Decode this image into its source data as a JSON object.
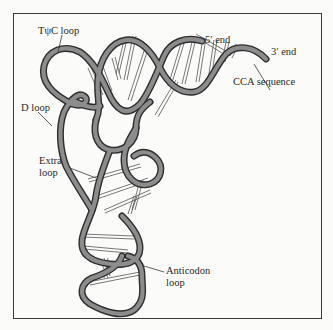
{
  "figure": {
    "labels": {
      "tpsic_loop": "TψC loop",
      "five_prime_end": "5′ end",
      "three_prime_end": "3′ end",
      "cca_sequence": "CCA sequence",
      "d_loop": "D loop",
      "extra_loop_line1": "Extra",
      "extra_loop_line2": "loop",
      "anticodon_loop_line1": "Anticodon",
      "anticodon_loop_line2": "loop"
    },
    "colors": {
      "background": "#fbfbf9",
      "frame": "#3a3a3a",
      "strand_fill": "#8c8c8c",
      "strand_outline": "#2e2e2e",
      "base_pair_lines": "#555555",
      "text": "#2a2a2a"
    }
  }
}
